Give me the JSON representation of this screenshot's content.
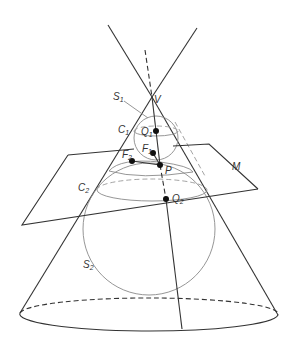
{
  "diagram": {
    "labels": {
      "apex": "V",
      "sphere_upper": {
        "base": "S",
        "sub": "1"
      },
      "sphere_lower": {
        "base": "S",
        "sub": "2"
      },
      "circle_upper": {
        "base": "C",
        "sub": "1"
      },
      "circle_lower": {
        "base": "C",
        "sub": "2"
      },
      "focus_1": {
        "base": "F",
        "sub": "1"
      },
      "focus_2": {
        "base": "F",
        "sub": "2"
      },
      "point_q1": {
        "base": "Q",
        "sub": "1"
      },
      "point_q2": {
        "base": "Q",
        "sub": "2"
      },
      "point_p": "P",
      "plane": "M"
    },
    "colors": {
      "line": "#333333",
      "sphere": "#8a8a8a",
      "point": "#111111"
    }
  }
}
